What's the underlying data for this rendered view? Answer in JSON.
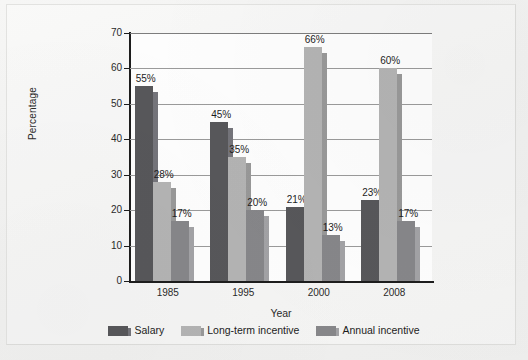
{
  "chart_data": {
    "type": "bar",
    "title": "",
    "subtitle": "",
    "xlabel": "Year",
    "ylabel": "Percentage",
    "categories": [
      "1985",
      "1995",
      "2000",
      "2008"
    ],
    "series": [
      {
        "name": "Salary",
        "color": "#57575a",
        "shadow_color": "#74747a",
        "values": [
          55,
          45,
          21,
          23
        ],
        "labels": [
          "55%",
          "45%",
          "21%",
          "23%"
        ]
      },
      {
        "name": "Long-term incentive",
        "color": "#b3b3b3",
        "shadow_color": "#989898",
        "values": [
          28,
          35,
          66,
          60
        ],
        "labels": [
          "28%",
          "35%",
          "66%",
          "60%"
        ]
      },
      {
        "name": "Annual incentive",
        "color": "#868689",
        "shadow_color": "#a2a2a5",
        "values": [
          17,
          20,
          13,
          17
        ],
        "labels": [
          "17%",
          "20%",
          "13%",
          "17%"
        ]
      }
    ],
    "ylim": [
      0,
      70
    ],
    "yticks": [
      0,
      10,
      20,
      30,
      40,
      50,
      60,
      70
    ],
    "ytick_labels": [
      "0",
      "10",
      "20",
      "30",
      "40",
      "50",
      "60",
      "70"
    ],
    "grid": "horizontal",
    "legend_position": "bottom-center"
  },
  "legend": {
    "items": [
      {
        "label": "Salary"
      },
      {
        "label": "Long-term incentive"
      },
      {
        "label": "Annual incentive"
      }
    ]
  },
  "axes": {
    "y_title": "Percentage",
    "x_title": "Year"
  }
}
